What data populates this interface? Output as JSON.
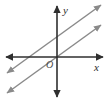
{
  "figure": {
    "kind": "coordinate-plane-diagram",
    "title": "",
    "width": 109,
    "height": 103,
    "background_color": "#ffffff"
  },
  "axes": {
    "color": "#2f2f2f",
    "stroke_width": 1.6,
    "origin": {
      "x": 57,
      "y": 57,
      "label": "O"
    },
    "x_axis": {
      "label": "x",
      "label_position": {
        "x": 95,
        "y": 69
      },
      "start": {
        "x": 6,
        "y": 57
      },
      "end": {
        "x": 103,
        "y": 57
      },
      "arrow_both_ends": true
    },
    "y_axis": {
      "label": "y",
      "label_position": {
        "x": 63,
        "y": 13
      },
      "start": {
        "x": 57,
        "y": 97
      },
      "end": {
        "x": 57,
        "y": 6
      },
      "arrow_both_ends": true
    }
  },
  "lines": {
    "color": "#8a8a8a",
    "stroke_width": 1.5,
    "relationship": "parallel",
    "items": [
      {
        "name": "upper-line",
        "slope": 0.72,
        "y_intercept_label": "above origin",
        "start": {
          "x": 7,
          "y": 93
        },
        "end": {
          "x": 101,
          "y": 25
        },
        "arrow_both_ends": true
      },
      {
        "name": "lower-line",
        "slope": 0.72,
        "y_intercept_label": "below origin",
        "start": {
          "x": 7,
          "y": 73
        },
        "end": {
          "x": 101,
          "y": 5
        },
        "arrow_both_ends": true
      }
    ]
  }
}
